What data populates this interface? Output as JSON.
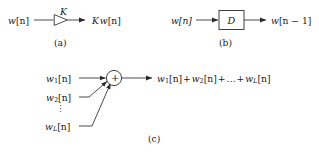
{
  "figure": {
    "caption_letters": {
      "a": "(a)",
      "b": "(b)",
      "c": "(c)"
    },
    "panel_a": {
      "name": "multiplier-gain-block",
      "input_label": "w[n]",
      "input_base": "w",
      "input_index": "[n]",
      "gain_label": "K",
      "output_label": "K w[n]",
      "block_shape": "triangle-right"
    },
    "panel_b": {
      "name": "unit-delay-block",
      "input_label": "w[n]",
      "block_label": "D",
      "output_label": "w[n − 1]",
      "output_base": "w",
      "output_index": "[n − 1]",
      "block_shape": "rectangle"
    },
    "panel_c": {
      "name": "adder-summing-junction",
      "operator_symbol": "+",
      "block_shape": "circle",
      "inputs": [
        {
          "base": "w",
          "sub": "1",
          "index": "[n]",
          "full": "w1[n]"
        },
        {
          "base": "w",
          "sub": "2",
          "index": "[n]",
          "full": "w2[n]"
        },
        {
          "base": "w",
          "sub": "L",
          "index": "[n]",
          "full": "wL[n]"
        }
      ],
      "ellipsis_vertical": "⋮",
      "output_terms": [
        "w1[n]",
        "+",
        "w2[n]",
        "+",
        "…",
        "+",
        "wL[n]"
      ],
      "output_label": "w1[n] + w2[n] + … + wL[n]"
    },
    "colors": {
      "background": "#ffffff",
      "ink": "#1a1a1a",
      "line": "#2b2b2b"
    }
  }
}
